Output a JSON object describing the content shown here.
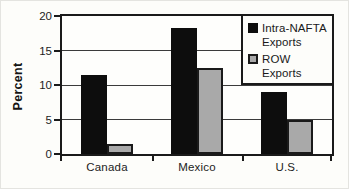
{
  "chart_data": {
    "type": "bar",
    "categories": [
      "Canada",
      "Mexico",
      "U.S."
    ],
    "series": [
      {
        "name": "Intra-NAFTA Exports",
        "color": "#0d0d0d",
        "values": [
          11.4,
          18.2,
          9.0
        ]
      },
      {
        "name": "ROW Exports",
        "color": "#a9a9a9",
        "values": [
          1.5,
          12.4,
          5.0
        ]
      }
    ],
    "title": "",
    "xlabel": "",
    "ylabel": "Percent",
    "ylim": [
      0,
      20
    ],
    "yticks": [
      0,
      5,
      10,
      15,
      20
    ],
    "grid": "horizontal",
    "legend_position": "top-right",
    "bar_border_color": "#1a1a1a"
  }
}
